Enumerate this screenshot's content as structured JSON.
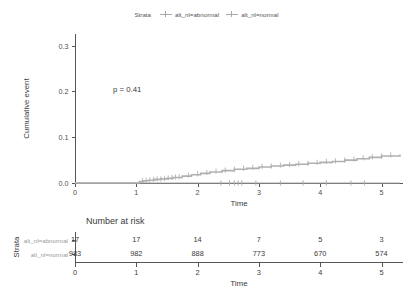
{
  "legend": {
    "title": "Strata",
    "entries": [
      {
        "label": "alt_nl=abnormal",
        "color": "#a8a8a8",
        "key": "line-plus-tick-key"
      },
      {
        "label": "alt_nl=normal",
        "color": "#a8a8a8",
        "key": "line-plus-tick-key"
      }
    ]
  },
  "main": {
    "annotation": "p = 0.41",
    "xlabel": "Time",
    "ylabel": "Cumulative event",
    "yticks": [
      "0.0",
      "0.1",
      "0.2",
      "0.3"
    ],
    "xticks": [
      "0",
      "1",
      "2",
      "3",
      "4",
      "5"
    ]
  },
  "risk": {
    "title": "Number at risk",
    "strata_title": "Strata",
    "xlabel": "Time",
    "xticks": [
      "0",
      "1",
      "2",
      "3",
      "4",
      "5"
    ],
    "rows": [
      {
        "label": "alt_nl=abnormal",
        "values": [
          "17",
          "17",
          "14",
          "7",
          "5",
          "3"
        ]
      },
      {
        "label": "alt_nl=normal",
        "values": [
          "983",
          "982",
          "888",
          "773",
          "670",
          "574"
        ]
      }
    ]
  },
  "chart_data": {
    "type": "line",
    "title": "",
    "xlabel": "Time",
    "ylabel": "Cumulative event",
    "xlim": [
      0,
      5.35
    ],
    "ylim": [
      0,
      0.325
    ],
    "yticks": [
      0.0,
      0.1,
      0.2,
      0.3
    ],
    "xticks": [
      0,
      1,
      2,
      3,
      4,
      5
    ],
    "grid": false,
    "legend_position": "top-center",
    "annotations": [
      {
        "text": "p = 0.41",
        "x": 1.2,
        "y": 0.205
      }
    ],
    "series": [
      {
        "name": "alt_nl=abnormal",
        "color": "#a8a8a8",
        "step": "hv",
        "x": [
          0,
          5.3
        ],
        "y": [
          0,
          0
        ],
        "censor_x": [
          2.38,
          2.52,
          2.6,
          2.66,
          2.72,
          2.95,
          3.35,
          3.72,
          4.1,
          4.5,
          4.72
        ],
        "censor_y": [
          0,
          0,
          0,
          0,
          0,
          0,
          0,
          0,
          0,
          0,
          0
        ]
      },
      {
        "name": "alt_nl=normal",
        "color": "#a8a8a8",
        "step": "hv",
        "x": [
          0,
          0.98,
          1.05,
          1.12,
          1.2,
          1.3,
          1.4,
          1.5,
          1.6,
          1.75,
          1.9,
          2.05,
          2.2,
          2.4,
          2.6,
          2.8,
          3.0,
          3.2,
          3.4,
          3.6,
          3.8,
          4.0,
          4.2,
          4.4,
          4.6,
          4.8,
          5.0,
          5.3
        ],
        "y": [
          0,
          0,
          0.003,
          0.005,
          0.006,
          0.008,
          0.009,
          0.01,
          0.012,
          0.015,
          0.018,
          0.021,
          0.024,
          0.027,
          0.03,
          0.032,
          0.035,
          0.037,
          0.039,
          0.041,
          0.043,
          0.045,
          0.047,
          0.05,
          0.053,
          0.056,
          0.059,
          0.062
        ],
        "censor_x": [
          1.1,
          1.16,
          1.22,
          1.28,
          1.34,
          1.4,
          1.46,
          1.52,
          1.58,
          1.64,
          1.7,
          1.85,
          2.0,
          2.15,
          2.3,
          2.45,
          2.6,
          2.75,
          2.9,
          3.05,
          3.2,
          3.35,
          3.5,
          3.65,
          3.8,
          3.95,
          4.1,
          4.25,
          4.4,
          4.55,
          4.7,
          4.85,
          5.0,
          5.15
        ],
        "censor_y": [
          0.005,
          0.006,
          0.007,
          0.008,
          0.009,
          0.009,
          0.01,
          0.011,
          0.012,
          0.013,
          0.014,
          0.017,
          0.02,
          0.023,
          0.026,
          0.028,
          0.03,
          0.032,
          0.034,
          0.036,
          0.037,
          0.039,
          0.04,
          0.042,
          0.043,
          0.045,
          0.047,
          0.048,
          0.05,
          0.052,
          0.055,
          0.057,
          0.059,
          0.061
        ]
      }
    ],
    "risk_table": {
      "times": [
        0,
        1,
        2,
        3,
        4,
        5
      ],
      "strata": [
        {
          "name": "alt_nl=abnormal",
          "n_at_risk": [
            17,
            17,
            14,
            7,
            5,
            3
          ]
        },
        {
          "name": "alt_nl=normal",
          "n_at_risk": [
            983,
            982,
            888,
            773,
            670,
            574
          ]
        }
      ]
    }
  }
}
